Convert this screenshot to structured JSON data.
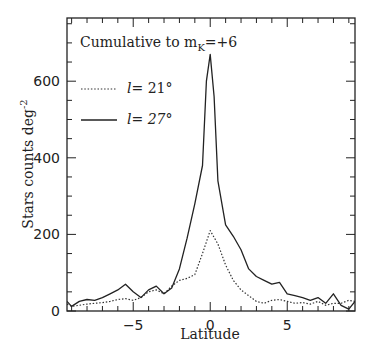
{
  "chart_data": {
    "type": "line",
    "title": "",
    "annotation": "Cumulative to m_K=+6",
    "annotation_parts": {
      "prefix": "Cumulative to m",
      "subscript": "K",
      "suffix": "=+6"
    },
    "xlabel": "Latitude",
    "ylabel": "Stars counts deg",
    "ylabel_superscript": "-2",
    "xlim": [
      -9.3,
      9.4
    ],
    "ylim": [
      0,
      765
    ],
    "xticks": [
      -5,
      0,
      5
    ],
    "xtick_labels": [
      "−5",
      "0",
      "5"
    ],
    "yticks": [
      0,
      200,
      400,
      600
    ],
    "ytick_labels": [
      "0",
      "200",
      "400",
      "600"
    ],
    "grid": false,
    "legend_position": "upper-left",
    "series": [
      {
        "name": "l= 21°",
        "legend_label_var": "l",
        "legend_label_value": "= 21°",
        "style": "dotted",
        "x": [
          -9.3,
          -9.0,
          -8.5,
          -8.0,
          -7.5,
          -7.0,
          -6.5,
          -6.0,
          -5.5,
          -5.0,
          -4.5,
          -4.0,
          -3.5,
          -3.0,
          -2.5,
          -2.0,
          -1.5,
          -1.0,
          -0.5,
          0.0,
          0.5,
          1.0,
          1.5,
          2.0,
          2.5,
          3.0,
          3.5,
          4.0,
          4.5,
          5.0,
          5.5,
          6.0,
          6.5,
          7.0,
          7.5,
          8.0,
          8.5,
          9.0,
          9.4
        ],
        "y": [
          18,
          12,
          15,
          18,
          20,
          22,
          25,
          30,
          32,
          28,
          35,
          50,
          55,
          45,
          65,
          80,
          85,
          95,
          150,
          210,
          175,
          120,
          80,
          55,
          40,
          25,
          20,
          28,
          30,
          25,
          20,
          22,
          18,
          25,
          15,
          20,
          20,
          28,
          25
        ]
      },
      {
        "name": "l= 27°",
        "legend_label_var": "l",
        "legend_label_value": "= 27°",
        "style": "solid",
        "x": [
          -9.3,
          -9.0,
          -8.5,
          -8.0,
          -7.5,
          -7.0,
          -6.5,
          -6.0,
          -5.5,
          -5.0,
          -4.5,
          -4.0,
          -3.5,
          -3.0,
          -2.5,
          -2.0,
          -1.5,
          -1.0,
          -0.5,
          -0.25,
          0.0,
          0.25,
          0.5,
          1.0,
          1.5,
          2.0,
          2.5,
          3.0,
          3.5,
          4.0,
          4.5,
          5.0,
          5.5,
          6.0,
          6.5,
          7.0,
          7.5,
          8.0,
          8.5,
          9.0,
          9.4
        ],
        "y": [
          25,
          12,
          25,
          30,
          28,
          35,
          45,
          55,
          70,
          50,
          35,
          55,
          65,
          45,
          60,
          110,
          190,
          280,
          380,
          600,
          670,
          560,
          340,
          225,
          195,
          160,
          110,
          90,
          80,
          70,
          75,
          45,
          40,
          35,
          28,
          35,
          20,
          45,
          15,
          5,
          25
        ]
      }
    ]
  }
}
